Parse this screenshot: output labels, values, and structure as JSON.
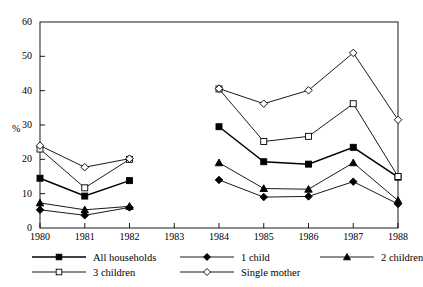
{
  "chart_data": {
    "type": "line",
    "title": "",
    "subtitle": "",
    "xlabel": "",
    "ylabel": "%",
    "x": [
      1980,
      1981,
      1982,
      1983,
      1984,
      1985,
      1986,
      1987,
      1988
    ],
    "xtick_labels": [
      "1980",
      "1981",
      "1982",
      "1983",
      "1984",
      "1985",
      "1986",
      "1987",
      "1988"
    ],
    "ytick_labels": [
      "0",
      "10",
      "20",
      "30",
      "40",
      "50",
      "60"
    ],
    "ytick_values": [
      0,
      10,
      20,
      30,
      40,
      50,
      60
    ],
    "ylim": [
      0,
      60
    ],
    "xlim": [
      1980,
      1988
    ],
    "grid": false,
    "legend_position": "below-axes",
    "series": [
      {
        "name": "All households",
        "marker": "filled-square",
        "values": [
          14.5,
          9.3,
          13.8,
          null,
          29.5,
          19.3,
          18.6,
          23.5,
          14.8
        ]
      },
      {
        "name": "1 child",
        "marker": "filled-diamond",
        "values": [
          5.3,
          3.7,
          6.0,
          null,
          14.0,
          9.0,
          9.2,
          13.5,
          7.0
        ]
      },
      {
        "name": "2 children",
        "marker": "filled-triangle",
        "values": [
          7.3,
          5.3,
          6.3,
          null,
          19.0,
          11.5,
          11.3,
          19.0,
          8.0
        ]
      },
      {
        "name": "3 children",
        "marker": "open-square",
        "values": [
          23.0,
          11.7,
          20.0,
          null,
          40.5,
          25.2,
          26.7,
          36.2,
          15.0
        ]
      },
      {
        "name": "Single mother",
        "marker": "open-diamond",
        "values": [
          24.0,
          17.7,
          20.2,
          null,
          40.6,
          36.2,
          40.1,
          51.0,
          31.5
        ]
      }
    ]
  },
  "legend": {
    "items": [
      {
        "label": "All households",
        "marker": "filled-square"
      },
      {
        "label": "1 child",
        "marker": "filled-diamond"
      },
      {
        "label": "2 children",
        "marker": "filled-triangle"
      },
      {
        "label": "3 children",
        "marker": "open-square"
      },
      {
        "label": "Single mother",
        "marker": "open-diamond"
      }
    ]
  }
}
